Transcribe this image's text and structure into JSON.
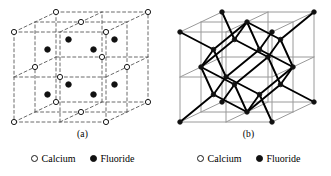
{
  "figure": {
    "background_color": "#ffffff",
    "panels": [
      {
        "id": "a",
        "caption": "(a)",
        "description": "Expanded unit cell with dashed cell edges showing ion positions",
        "edge_style": "dashed",
        "edge_color": "#5a5a5a",
        "bonds_shown": false
      },
      {
        "id": "b",
        "caption": "(b)",
        "description": "Unit cell with solid grid edges and heavy bonds between calcium and fluoride ions",
        "edge_style": "solid",
        "edge_color": "#9a9a9a",
        "bond_color": "#000000",
        "bonds_shown": true
      }
    ]
  },
  "legend": {
    "entries": [
      {
        "symbol": "open-circle",
        "label": "Calcium",
        "color": "#ffffff",
        "outline": "#1a1a1a"
      },
      {
        "symbol": "filled-circle",
        "label": "Fluoride",
        "color": "#111111",
        "outline": "#111111"
      }
    ]
  },
  "chart_data": {
    "type": "diagram",
    "subtitle": "",
    "xlabel": "",
    "ylabel": "",
    "legend_position": "bottom",
    "grid": false,
    "species": [
      {
        "name": "Calcium",
        "marker": "open-circle",
        "lattice": "face-centered cubic",
        "count_in_cell": 14
      },
      {
        "name": "Fluoride",
        "marker": "filled-circle",
        "lattice": "simple cubic interior",
        "count_in_cell": 8
      }
    ],
    "panels": [
      {
        "id": "a",
        "label": "(a)",
        "edges": "dashed",
        "bonds": false
      },
      {
        "id": "b",
        "label": "(b)",
        "edges": "solid",
        "bonds": true
      }
    ],
    "calcium_fractional_positions": [
      [
        0,
        0,
        0
      ],
      [
        1,
        0,
        0
      ],
      [
        0,
        1,
        0
      ],
      [
        1,
        1,
        0
      ],
      [
        0,
        0,
        1
      ],
      [
        1,
        0,
        1
      ],
      [
        0,
        1,
        1
      ],
      [
        1,
        1,
        1
      ],
      [
        0.5,
        0.5,
        0
      ],
      [
        0.5,
        0.5,
        1
      ],
      [
        0.5,
        0,
        0.5
      ],
      [
        0.5,
        1,
        0.5
      ],
      [
        0,
        0.5,
        0.5
      ],
      [
        1,
        0.5,
        0.5
      ]
    ],
    "fluoride_fractional_positions": [
      [
        0.25,
        0.25,
        0.25
      ],
      [
        0.75,
        0.25,
        0.25
      ],
      [
        0.25,
        0.75,
        0.25
      ],
      [
        0.75,
        0.75,
        0.25
      ],
      [
        0.25,
        0.25,
        0.75
      ],
      [
        0.75,
        0.25,
        0.75
      ],
      [
        0.25,
        0.75,
        0.75
      ],
      [
        0.75,
        0.75,
        0.75
      ]
    ],
    "projection": {
      "type": "oblique",
      "x_axis": [
        92,
        0
      ],
      "y_axis": [
        0,
        90
      ],
      "z_axis": [
        42,
        -20
      ]
    },
    "origin_px": [
      14,
      122
    ]
  }
}
